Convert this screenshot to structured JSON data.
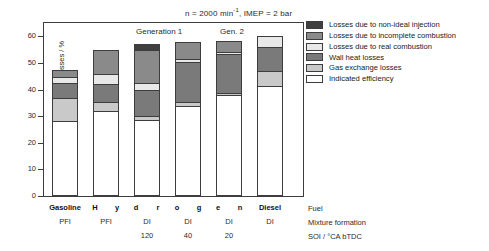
{
  "chart_data": {
    "type": "bar",
    "stacked": true,
    "title_parts": {
      "pre": "n = 2000 min",
      "sup": "-1",
      "post": ", IMEP = 2 bar"
    },
    "xlabel": "",
    "ylabel": "Efficiency and Losses / %",
    "ylim": [
      0,
      65
    ],
    "yticks": [
      0,
      10,
      20,
      30,
      40,
      50,
      60
    ],
    "ytick_labels": [
      "0",
      "10",
      "20",
      "30",
      "40",
      "50",
      "60"
    ],
    "grid": false,
    "legend_position": "right",
    "categories": [
      "Gasoline PFI",
      "Hydrogen PFI",
      "Hydrogen DI 120",
      "Hydrogen DI 40",
      "Hydrogen DI 20",
      "Diesel DI"
    ],
    "series": [
      {
        "name": "Indicated efficiency",
        "color": "#ffffff",
        "values": [
          28.3,
          32.0,
          28.5,
          34.0,
          37.8,
          41.5
        ]
      },
      {
        "name": "Gas exchange losses",
        "color": "#c9c9c9",
        "values": [
          8.5,
          3.5,
          1.5,
          1.5,
          0.8,
          5.5
        ]
      },
      {
        "name": "Wall heat losses",
        "color": "#7a7a7a",
        "values": [
          5.6,
          6.5,
          10.0,
          15.0,
          14.8,
          9.0
        ]
      },
      {
        "name": "Losses due to real combustion",
        "color": "#e8e8e8",
        "values": [
          2.4,
          4.0,
          2.5,
          0.8,
          0.8,
          4.0
        ]
      },
      {
        "name": "Losses due to incomplete combustion",
        "color": "#8a8a8a",
        "values": [
          2.4,
          9.0,
          12.5,
          6.5,
          4.2,
          0.0
        ]
      },
      {
        "name": "Losses due to non-ideal injection",
        "color": "#3f3f3f",
        "values": [
          0.0,
          0.0,
          2.3,
          0.0,
          0.0,
          0.0
        ]
      }
    ],
    "totals": [
      47.2,
      55.0,
      57.3,
      57.8,
      58.4,
      60.0
    ],
    "annotations": [
      {
        "text": "Generation 1",
        "x_category_center": "Hydrogen DI 120/40"
      },
      {
        "text": "Gen. 2",
        "x_category_center": "Hydrogen DI 20"
      }
    ]
  },
  "legend": {
    "items": [
      {
        "label": "Losses due to non-ideal injection",
        "color": "#3f3f3f"
      },
      {
        "label": "Losses due to incomplete combustion",
        "color": "#8a8a8a"
      },
      {
        "label": "Losses due to real combustion",
        "color": "#e8e8e8"
      },
      {
        "label": "Wall heat losses",
        "color": "#7a7a7a"
      },
      {
        "label": "Gas exchange losses",
        "color": "#c9c9c9"
      },
      {
        "label": "Indicated efficiency",
        "color": "#ffffff"
      }
    ]
  },
  "annotations": {
    "generation_1": "Generation 1",
    "generation_2": "Gen. 2"
  },
  "xaxis_table": {
    "row_labels": [
      "Fuel",
      "Mixture formation",
      "SOI / °CA bTDC"
    ],
    "fuel_row": [
      "Gasoline",
      "H",
      "y",
      "d",
      "r",
      "o",
      "g",
      "e",
      "n",
      "Diesel"
    ],
    "fuel_cells": [
      {
        "text": "Gasoline",
        "bold": true
      },
      {
        "text": "H",
        "bold": true
      },
      {
        "text": "y",
        "bold": true
      },
      {
        "text": "d",
        "bold": true
      },
      {
        "text": "r",
        "bold": true
      },
      {
        "text": "o",
        "bold": true
      },
      {
        "text": "g",
        "bold": true
      },
      {
        "text": "e",
        "bold": true
      },
      {
        "text": "n",
        "bold": true
      },
      {
        "text": "Diesel",
        "bold": true
      }
    ],
    "mixture_row": [
      "PFI",
      "PFI",
      "DI",
      "DI",
      "DI",
      "DI"
    ],
    "soi_row": [
      "",
      "",
      "120",
      "40",
      "20",
      ""
    ]
  }
}
